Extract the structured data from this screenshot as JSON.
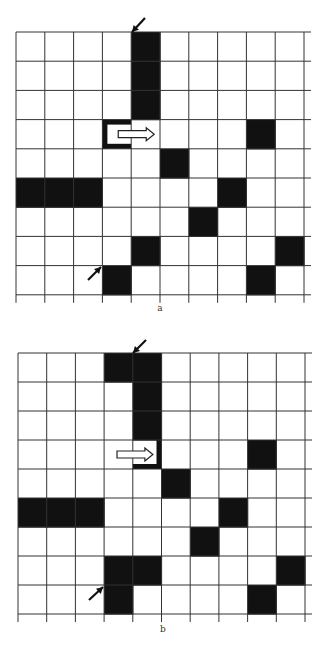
{
  "figure": {
    "panels": [
      {
        "id": "a",
        "label": "a",
        "origin": {
          "x": 16,
          "y": 32
        },
        "cell_w": 28.8,
        "cell_h": 29.2,
        "cols": 10,
        "rows": 9,
        "line_extend_right": 7,
        "line_extend_bottom": 8,
        "label_pos": {
          "x": 160,
          "y": 305
        },
        "black_cells": [
          [
            0,
            4
          ],
          [
            1,
            4
          ],
          [
            2,
            4
          ],
          [
            3,
            8
          ],
          [
            4,
            5
          ],
          [
            5,
            0
          ],
          [
            5,
            1
          ],
          [
            5,
            2
          ],
          [
            5,
            7
          ],
          [
            6,
            6
          ],
          [
            7,
            4
          ],
          [
            7,
            9
          ],
          [
            8,
            3
          ],
          [
            8,
            8
          ]
        ],
        "frame_cell": {
          "row": 3,
          "col": 3,
          "type": "open-right",
          "thickness": 5
        },
        "move_arrow": {
          "row": 3,
          "from_col": 3,
          "direction": "right",
          "start_offset": 0.55,
          "length": 1.25
        },
        "pointer_arrows": [
          {
            "x1": 145,
            "y1": 18,
            "x2": 132,
            "y2": 32
          },
          {
            "x1": 88,
            "y1": 280,
            "x2": 101,
            "y2": 267
          }
        ]
      },
      {
        "id": "b",
        "label": "b",
        "origin": {
          "x": 18,
          "y": 353
        },
        "cell_w": 28.7,
        "cell_h": 29.0,
        "cols": 10,
        "rows": 9,
        "line_extend_right": 7,
        "line_extend_bottom": 8,
        "label_pos": {
          "x": 163,
          "y": 625
        },
        "black_cells": [
          [
            0,
            3
          ],
          [
            0,
            4
          ],
          [
            1,
            4
          ],
          [
            2,
            4
          ],
          [
            3,
            8
          ],
          [
            4,
            5
          ],
          [
            5,
            0
          ],
          [
            5,
            1
          ],
          [
            5,
            2
          ],
          [
            5,
            7
          ],
          [
            6,
            6
          ],
          [
            7,
            3
          ],
          [
            7,
            4
          ],
          [
            7,
            9
          ],
          [
            8,
            3
          ],
          [
            8,
            8
          ]
        ],
        "frame_cell": {
          "row": 3,
          "col": 4,
          "type": "open-left",
          "thickness": 5
        },
        "move_arrow": {
          "row": 3,
          "from_col": 3,
          "direction": "right",
          "start_offset": 0.45,
          "length": 1.25
        },
        "pointer_arrows": [
          {
            "x1": 146,
            "y1": 340,
            "x2": 133,
            "y2": 353
          },
          {
            "x1": 89,
            "y1": 600,
            "x2": 103,
            "y2": 587
          }
        ]
      }
    ],
    "colors": {
      "grid_line": "#333333",
      "cell_fill": "#111111",
      "background": "#ffffff",
      "arrow_outline": "#222222"
    }
  }
}
